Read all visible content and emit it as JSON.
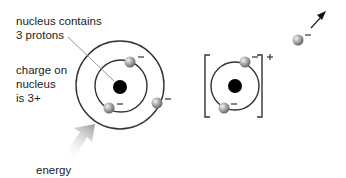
{
  "labels": {
    "nucleus_line1": "nucleus contains",
    "nucleus_line2": "3 protons",
    "charge_line1": "charge on",
    "charge_line2": "nucleus",
    "charge_line3": "is 3+",
    "energy": "energy"
  },
  "symbols": {
    "electron_charge": "−",
    "ion_charge": "+"
  },
  "atom": {
    "description": "lithium atom: nucleus with 3 protons, 2 electrons in inner shell, 1 electron in outer shell",
    "inner_shell_electrons": 2,
    "outer_shell_electrons": 1
  },
  "ion": {
    "description": "lithium ion in brackets with 2 electrons, charge +",
    "electrons": 2
  },
  "free_electron": {
    "description": "electron leaving, arrow pointing up-right"
  },
  "colors": {
    "line": "#333333",
    "nucleus": "#000000",
    "electron": "#9a9a9a",
    "energy_arrow": "#9e9e9e"
  }
}
